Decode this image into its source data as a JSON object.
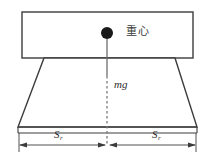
{
  "figure": {
    "title_text": "",
    "background_color": "#ffffff",
    "stroke_color": "#3c3c3c",
    "dash_color": "#6b6b6b",
    "marker_color": "#1a1a1a",
    "labels": {
      "center_of_gravity": "重心",
      "weight_force": "mg",
      "dimension_left_symbol": "S",
      "dimension_left_subscript": "r",
      "dimension_right_symbol": "S",
      "dimension_right_subscript": "r"
    },
    "geometry": {
      "top_block": {
        "x": 22,
        "y": 12,
        "width": 171,
        "height": 46
      },
      "trapezoid_top_left_x": 44,
      "trapezoid_top_right_x": 175,
      "trapezoid_bottom_left_x": 18,
      "trapezoid_bottom_right_x": 197,
      "trapezoid_top_y": 58,
      "trapezoid_bottom_y": 127,
      "baseline_y": 133,
      "dimension_line_y": 145,
      "center_x": 107,
      "cog_marker_x": 107,
      "cog_marker_y": 33,
      "cog_marker_radius": 6,
      "solid_line_end_y": 75
    }
  }
}
